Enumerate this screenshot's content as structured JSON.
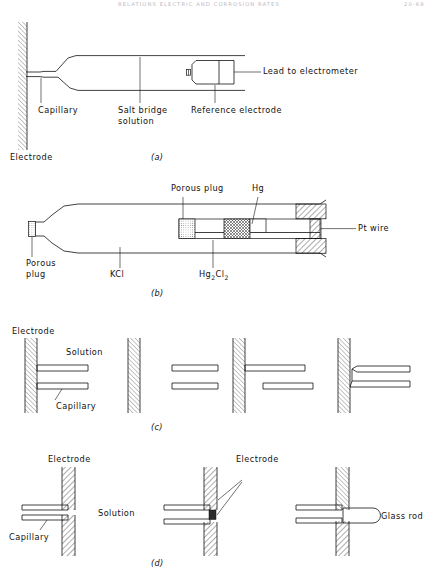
{
  "page": {
    "running_head_left": "RELATIONS  ELECTRIC  AND  CORROSION  RATES",
    "running_head_right": "20-69",
    "width": 442,
    "height": 571,
    "background": "#ffffff",
    "ink": "#111111"
  },
  "figure": {
    "type": "technical-line-diagram",
    "panels": [
      {
        "id": "a",
        "caption": "(a)",
        "labels": [
          {
            "name": "capillary",
            "text": "Capillary"
          },
          {
            "name": "salt-bridge-solution",
            "text": "Salt bridge",
            "text2": "solution"
          },
          {
            "name": "reference-electrode",
            "text": "Reference electrode"
          },
          {
            "name": "lead-to-electrometer",
            "text": "Lead to electrometer"
          },
          {
            "name": "electrode",
            "text": "Electrode"
          }
        ]
      },
      {
        "id": "b",
        "caption": "(b)",
        "labels": [
          {
            "name": "porous-plug-left",
            "text": "Porous",
            "text2": "plug"
          },
          {
            "name": "porous-plug-top",
            "text": "Porous  plug"
          },
          {
            "name": "mercury",
            "text": "Hg"
          },
          {
            "name": "pt-wire",
            "text": "Pt  wire"
          },
          {
            "name": "potassium-chloride",
            "text": "KCl"
          },
          {
            "name": "mercurous-chloride",
            "text": "Hg",
            "sub1": "2",
            "text2": "Cl",
            "sub2": "2"
          }
        ]
      },
      {
        "id": "c",
        "caption": "(c)",
        "labels": [
          {
            "name": "electrode",
            "text": "Electrode"
          },
          {
            "name": "solution",
            "text": "Solution"
          },
          {
            "name": "capillary",
            "text": "Capillary"
          }
        ]
      },
      {
        "id": "d",
        "caption": "(d)",
        "labels": [
          {
            "name": "electrode-left",
            "text": "Electrode"
          },
          {
            "name": "electrode-mid",
            "text": "Electrode"
          },
          {
            "name": "solution",
            "text": "Solution"
          },
          {
            "name": "capillary",
            "text": "Capillary"
          },
          {
            "name": "glass-rod",
            "text": "Glass rod"
          }
        ]
      }
    ]
  }
}
